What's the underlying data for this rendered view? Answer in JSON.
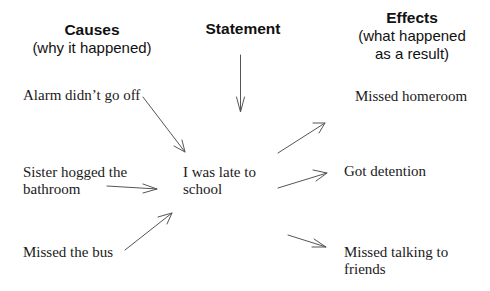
{
  "headers": {
    "causes": {
      "title": "Causes",
      "subtitle": "(why it happened)"
    },
    "statement": {
      "title": "Statement"
    },
    "effects": {
      "title": "Effects",
      "subtitle_line1": "(what happened",
      "subtitle_line2": "as a result)"
    }
  },
  "statement": {
    "line1": "I was late to",
    "line2": "school"
  },
  "causes": [
    {
      "line1": "Alarm didn’t go off",
      "line2": ""
    },
    {
      "line1": "Sister hogged the",
      "line2": "bathroom"
    },
    {
      "line1": "Missed the bus",
      "line2": ""
    }
  ],
  "effects": [
    {
      "line1": "Missed homeroom",
      "line2": ""
    },
    {
      "line1": "Got detention",
      "line2": ""
    },
    {
      "line1": "Missed talking to",
      "line2": "friends"
    }
  ],
  "colors": {
    "text": "#1a1a1a",
    "arrow": "#555555",
    "background": "#ffffff"
  }
}
